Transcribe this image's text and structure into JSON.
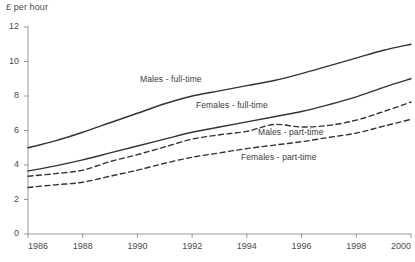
{
  "chart_data": {
    "type": "line",
    "title": "£ per hour",
    "xlabel": "",
    "ylabel": "£ per hour",
    "xlim": [
      1986,
      2000
    ],
    "ylim": [
      0,
      12
    ],
    "grid": false,
    "legend_position": "inline-annotations",
    "x": [
      1986,
      1987,
      1988,
      1989,
      1990,
      1991,
      1992,
      1993,
      1994,
      1995,
      1996,
      1997,
      1998,
      1999,
      2000
    ],
    "xticks": [
      1986,
      1988,
      1990,
      1992,
      1994,
      1996,
      1998,
      2000
    ],
    "xtick_labels": [
      "1986",
      "1988",
      "1990",
      "1992",
      "1994",
      "1996",
      "1998",
      "2000"
    ],
    "yticks": [
      0,
      2,
      4,
      6,
      8,
      10,
      12
    ],
    "ytick_labels": [
      "0",
      "2",
      "4",
      "6",
      "8",
      "10",
      "12"
    ],
    "series": [
      {
        "name": "Males - full-time",
        "style": "solid",
        "color": "#333333",
        "label_text": "Males - full-time",
        "values": [
          5.0,
          5.4,
          5.9,
          6.45,
          7.0,
          7.55,
          8.0,
          8.3,
          8.6,
          8.9,
          9.3,
          9.75,
          10.2,
          10.65,
          11.0
        ]
      },
      {
        "name": "Females - full-time",
        "style": "solid",
        "color": "#333333",
        "label_text": "Females - full-time",
        "values": [
          3.65,
          3.95,
          4.3,
          4.7,
          5.1,
          5.5,
          5.9,
          6.2,
          6.5,
          6.8,
          7.1,
          7.5,
          7.95,
          8.5,
          9.0
        ]
      },
      {
        "name": "Males - part-time",
        "style": "dashed",
        "color": "#333333",
        "label_text": "Males - part-time",
        "values": [
          3.35,
          3.5,
          3.7,
          4.2,
          4.6,
          5.05,
          5.5,
          5.75,
          5.95,
          6.35,
          6.2,
          6.3,
          6.6,
          7.1,
          7.65
        ]
      },
      {
        "name": "Females - part-time",
        "style": "dashed",
        "color": "#333333",
        "label_text": "Females - part-time",
        "values": [
          2.7,
          2.85,
          3.0,
          3.35,
          3.7,
          4.1,
          4.45,
          4.7,
          4.95,
          5.15,
          5.35,
          5.6,
          5.85,
          6.25,
          6.65
        ]
      }
    ],
    "annotations": [
      {
        "text": "Males - full-time",
        "x_px": 140,
        "y_px": 74
      },
      {
        "text": "Females - full-time",
        "x_px": 196,
        "y_px": 100
      },
      {
        "text": "Males - part-time",
        "x_px": 258,
        "y_px": 127
      },
      {
        "text": "Females - part-time",
        "x_px": 241,
        "y_px": 152
      }
    ],
    "colors": {
      "line": "#333333",
      "axis": "#9a9a9a",
      "text": "#4a4a4a",
      "background": "#ffffff"
    }
  }
}
